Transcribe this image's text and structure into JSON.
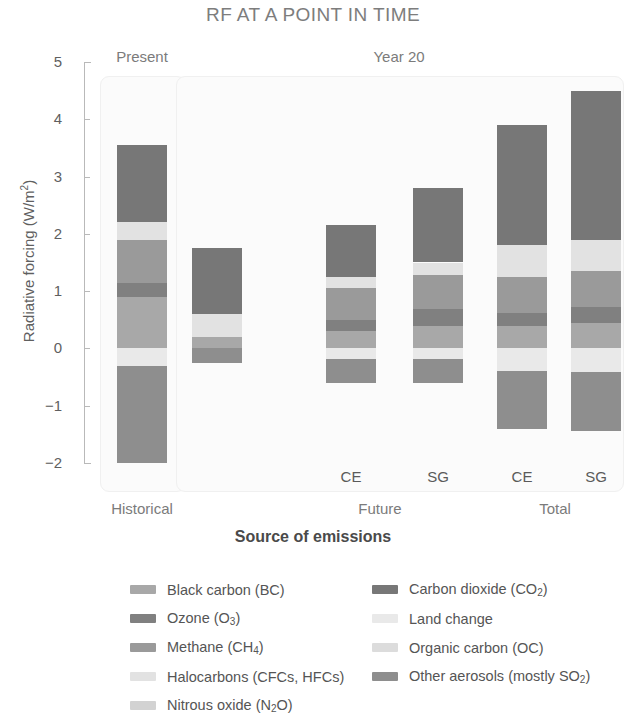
{
  "chart_data": {
    "type": "bar",
    "subtype": "stacked-bar-diverging",
    "title": "RF AT A POINT IN TIME",
    "xlabel": "Source of emissions",
    "ylabel": "Radiative forcing (W/m²)",
    "ylim": [
      -2,
      5
    ],
    "yticks": [
      5,
      4,
      3,
      2,
      1,
      0,
      -1,
      -2
    ],
    "ytick_labels": [
      "5",
      "4",
      "3",
      "2",
      "1",
      "0",
      "−1",
      "−2"
    ],
    "grid": false,
    "legend_position": "bottom",
    "panels": [
      {
        "label": "Present"
      },
      {
        "label": "Year 20"
      }
    ],
    "groups": [
      {
        "label": "Historical",
        "bars": [
          ""
        ]
      },
      {
        "label": "Future",
        "bars": [
          "CE",
          "SG"
        ]
      },
      {
        "label": "Total",
        "bars": [
          "CE",
          "SG"
        ]
      }
    ],
    "series": [
      {
        "name": "Black carbon (BC)",
        "key": "bc",
        "color": "#a8a8a8"
      },
      {
        "name": "Ozone (O₃)",
        "key": "o3",
        "color": "#808080"
      },
      {
        "name": "Methane (CH₄)",
        "key": "ch4",
        "color": "#9a9a9a"
      },
      {
        "name": "Halocarbons (CFCs, HFCs)",
        "key": "halo",
        "color": "#e2e2e2"
      },
      {
        "name": "Nitrous oxide (N₂O)",
        "key": "n2o",
        "color": "#d2d2d2"
      },
      {
        "name": "Carbon dioxide (CO₂)",
        "key": "co2",
        "color": "#777777"
      },
      {
        "name": "Land change",
        "key": "land",
        "color": "#e9e9e9"
      },
      {
        "name": "Organic carbon (OC)",
        "key": "oc",
        "color": "#dcdcdc"
      },
      {
        "name": "Other aerosols (mostly SO₂)",
        "key": "aero",
        "color": "#8e8e8e"
      }
    ],
    "bars": [
      {
        "id": "historical",
        "panel": "Present",
        "group": "Historical",
        "sub_label": "",
        "positive_total": 3.55,
        "negative_total": -2.0,
        "segments": [
          {
            "key": "bc",
            "value": 0.9
          },
          {
            "key": "o3",
            "value": 0.25
          },
          {
            "key": "ch4",
            "value": 0.75
          },
          {
            "key": "halo",
            "value": 0.3
          },
          {
            "key": "co2",
            "value": 1.35
          },
          {
            "key": "land",
            "value": -0.3
          },
          {
            "key": "aero",
            "value": -1.7
          }
        ]
      },
      {
        "id": "year20-present",
        "panel": "Year 20",
        "group": "Historical",
        "sub_label": "",
        "positive_total": 1.75,
        "negative_total": -0.25,
        "segments": [
          {
            "key": "bc",
            "value": 0.2
          },
          {
            "key": "halo",
            "value": 0.4
          },
          {
            "key": "co2",
            "value": 1.15
          },
          {
            "key": "aero",
            "value": -0.25
          }
        ]
      },
      {
        "id": "future-ce",
        "panel": "Year 20",
        "group": "Future",
        "sub_label": "CE",
        "positive_total": 2.15,
        "negative_total": -0.6,
        "segments": [
          {
            "key": "bc",
            "value": 0.3
          },
          {
            "key": "o3",
            "value": 0.2
          },
          {
            "key": "ch4",
            "value": 0.55
          },
          {
            "key": "halo",
            "value": 0.2
          },
          {
            "key": "co2",
            "value": 0.9
          },
          {
            "key": "land",
            "value": -0.18
          },
          {
            "key": "aero",
            "value": -0.42
          }
        ]
      },
      {
        "id": "future-sg",
        "panel": "Year 20",
        "group": "Future",
        "sub_label": "SG",
        "positive_total": 2.8,
        "negative_total": -0.6,
        "segments": [
          {
            "key": "bc",
            "value": 0.4
          },
          {
            "key": "o3",
            "value": 0.28
          },
          {
            "key": "ch4",
            "value": 0.6
          },
          {
            "key": "halo",
            "value": 0.22
          },
          {
            "key": "co2",
            "value": 1.3
          },
          {
            "key": "land",
            "value": -0.18
          },
          {
            "key": "aero",
            "value": -0.42
          }
        ]
      },
      {
        "id": "total-ce",
        "panel": "Year 20",
        "group": "Total",
        "sub_label": "CE",
        "positive_total": 3.9,
        "negative_total": -1.4,
        "segments": [
          {
            "key": "bc",
            "value": 0.4
          },
          {
            "key": "o3",
            "value": 0.22
          },
          {
            "key": "ch4",
            "value": 0.63
          },
          {
            "key": "halo",
            "value": 0.55
          },
          {
            "key": "co2",
            "value": 2.1
          },
          {
            "key": "land",
            "value": -0.4
          },
          {
            "key": "aero",
            "value": -1.0
          }
        ]
      },
      {
        "id": "total-sg",
        "panel": "Year 20",
        "group": "Total",
        "sub_label": "SG",
        "positive_total": 4.5,
        "negative_total": -1.45,
        "segments": [
          {
            "key": "bc",
            "value": 0.45
          },
          {
            "key": "o3",
            "value": 0.28
          },
          {
            "key": "ch4",
            "value": 0.62
          },
          {
            "key": "halo",
            "value": 0.55
          },
          {
            "key": "co2",
            "value": 2.6
          },
          {
            "key": "land",
            "value": -0.42
          },
          {
            "key": "aero",
            "value": -1.03
          }
        ]
      }
    ]
  }
}
